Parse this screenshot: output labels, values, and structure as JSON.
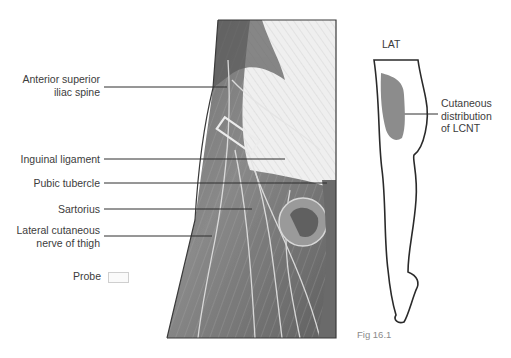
{
  "figure": {
    "caption": "Fig 16.1",
    "labels_left": [
      {
        "id": "asis",
        "lines": [
          "Anterior superior",
          "iliac spine"
        ]
      },
      {
        "id": "inguinal",
        "lines": [
          "Inguinal ligament"
        ]
      },
      {
        "id": "pubic",
        "lines": [
          "Pubic tubercle"
        ]
      },
      {
        "id": "sartorius",
        "lines": [
          "Sartorius"
        ]
      },
      {
        "id": "lcnt",
        "lines": [
          "Lateral cutaneous",
          "nerve of thigh"
        ]
      }
    ],
    "legend": {
      "probe_label": "Probe"
    },
    "leg_diagram": {
      "orientation_label": "LAT",
      "area_label_lines": [
        "Cutaneous",
        "distribution",
        "of LCNT"
      ],
      "area_color": "#8c8c8c"
    }
  }
}
